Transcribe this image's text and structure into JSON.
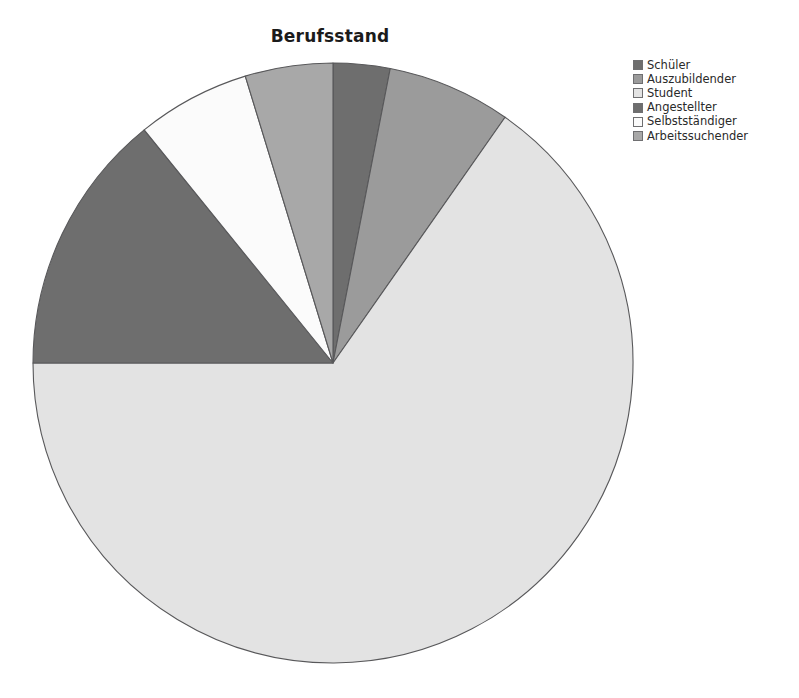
{
  "title": "Berufsstand",
  "background_color": "#ffffff",
  "chart_data": {
    "type": "pie",
    "title": "Berufsstand",
    "xlabel": "",
    "ylabel": "",
    "start_angle_deg": 0,
    "direction": "clockwise",
    "legend_position": "top-right",
    "grid": false,
    "categories": [
      "Schüler",
      "Auszubildender",
      "Student",
      "Angestellter",
      "Selbstständiger",
      "Arbeitssuchender"
    ],
    "values": [
      11,
      24,
      235,
      51,
      22,
      17
    ],
    "value_unit": "degrees",
    "percentages": [
      3.1,
      6.7,
      65.3,
      14.2,
      6.1,
      4.7
    ],
    "colors": [
      "#6e6e6e",
      "#9b9b9b",
      "#e3e3e3",
      "#6e6e6e",
      "#fbfbfb",
      "#a8a8a8"
    ],
    "slice_border_color": "#58585a",
    "slices": [
      {
        "label": "Schüler",
        "angle": 11,
        "percent": 3.1,
        "color": "#6e6e6e"
      },
      {
        "label": "Auszubildender",
        "angle": 24,
        "percent": 6.7,
        "color": "#9b9b9b"
      },
      {
        "label": "Student",
        "angle": 235,
        "percent": 65.3,
        "color": "#e3e3e3"
      },
      {
        "label": "Angestellter",
        "angle": 51,
        "percent": 14.2,
        "color": "#6e6e6e"
      },
      {
        "label": "Selbstständiger",
        "angle": 22,
        "percent": 6.1,
        "color": "#fbfbfb"
      },
      {
        "label": "Arbeitssuchender",
        "angle": 17,
        "percent": 4.7,
        "color": "#a8a8a8"
      }
    ]
  },
  "legend": {
    "items": [
      {
        "label": "Schüler",
        "color": "#6e6e6e"
      },
      {
        "label": "Auszubildender",
        "color": "#9b9b9b"
      },
      {
        "label": "Student",
        "color": "#e3e3e3"
      },
      {
        "label": "Angestellter",
        "color": "#6e6e6e"
      },
      {
        "label": "Selbstständiger",
        "color": "#fbfbfb"
      },
      {
        "label": "Arbeitssuchender",
        "color": "#a8a8a8"
      }
    ]
  },
  "geometry": {
    "center_x": 333,
    "center_y": 363,
    "radius": 300
  }
}
